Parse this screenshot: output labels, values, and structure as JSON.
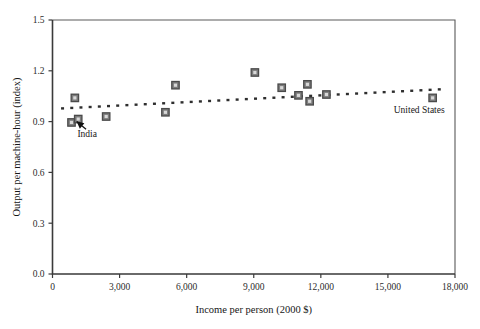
{
  "chart_data": {
    "type": "scatter",
    "title": "",
    "xlabel": "Income per person (2000 $)",
    "ylabel": "Output per machine-hour (index)",
    "xlim": [
      0,
      18000
    ],
    "ylim": [
      0.0,
      1.5
    ],
    "xticks": [
      0,
      3000,
      6000,
      9000,
      12000,
      15000,
      18000
    ],
    "xticklabels": [
      "0",
      "3,000",
      "6,000",
      "9,000",
      "12,000",
      "15,000",
      "18,000"
    ],
    "yticks": [
      0.0,
      0.3,
      0.6,
      0.9,
      1.2,
      1.5
    ],
    "yticklabels": [
      "0.0",
      "0.3",
      "0.6",
      "0.9",
      "1.2",
      "1.5"
    ],
    "grid": false,
    "legend": "none",
    "marker_style": "filled-square",
    "marker_color": "#7d7d7d",
    "marker_edge_color": "#4a4a4a",
    "points": [
      {
        "x": 1000,
        "y": 1.04
      },
      {
        "x": 850,
        "y": 0.895
      },
      {
        "x": 1150,
        "y": 0.915
      },
      {
        "x": 2400,
        "y": 0.93
      },
      {
        "x": 5050,
        "y": 0.955
      },
      {
        "x": 5500,
        "y": 1.115
      },
      {
        "x": 9050,
        "y": 1.19
      },
      {
        "x": 10250,
        "y": 1.1
      },
      {
        "x": 11000,
        "y": 1.055
      },
      {
        "x": 11400,
        "y": 1.12
      },
      {
        "x": 11500,
        "y": 1.02
      },
      {
        "x": 12250,
        "y": 1.06
      },
      {
        "x": 17000,
        "y": 1.04
      }
    ],
    "trendline": {
      "style": "dotted",
      "color": "#2e2e2e",
      "x_start": 450,
      "y_start": 0.978,
      "x_end": 17550,
      "y_end": 1.092
    },
    "annotations": [
      {
        "label": "India",
        "label_x": 1550,
        "label_y": 0.812,
        "arrow_from_x": 1500,
        "arrow_from_y": 0.855,
        "arrow_to_x": 1080,
        "arrow_to_y": 0.9
      },
      {
        "label": "United States",
        "label_x": 16400,
        "label_y": 0.952,
        "arrow_from_x": null,
        "arrow_from_y": null,
        "arrow_to_x": null,
        "arrow_to_y": null
      }
    ]
  }
}
